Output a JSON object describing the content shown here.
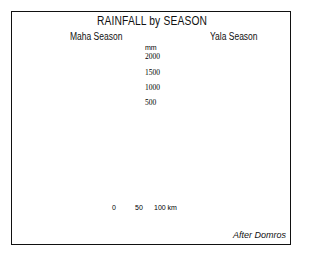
{
  "title": "RAINFALL by SEASON",
  "maps": [
    {
      "season": "Maha Season",
      "places": [
        "A",
        "T",
        "K",
        "C",
        "R",
        "B",
        "H",
        "M"
      ]
    },
    {
      "season": "Yala Season",
      "places": [
        "A",
        "T",
        "K",
        "C",
        "R",
        "B",
        "H",
        "M"
      ]
    }
  ],
  "legend": {
    "unit": "mm",
    "classes": [
      {
        "range": "> 2000",
        "pattern": "dark-grey"
      },
      {
        "range": "1500-2000",
        "pattern": "light-grey"
      },
      {
        "range": "1000-1500",
        "pattern": "dense-dots"
      },
      {
        "range": "500-1000",
        "pattern": "sparse-dots"
      },
      {
        "range": "< 500",
        "pattern": "white"
      }
    ],
    "ticks": [
      "2000",
      "1500",
      "1000",
      "500"
    ]
  },
  "scale": {
    "ticks": [
      "0",
      "50",
      "100 km"
    ]
  },
  "credit": "After Domros",
  "colors": {
    "ink": "#111111",
    "dark": "#8a8a8a",
    "light": "#bdbdbd",
    "dots": "#555555"
  }
}
